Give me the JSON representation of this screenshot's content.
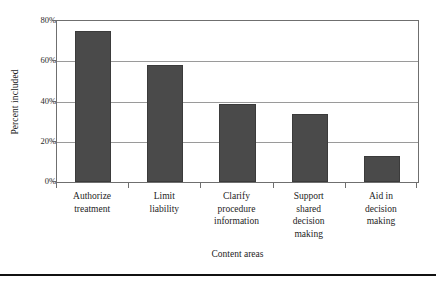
{
  "chart_data": {
    "type": "bar",
    "title": "",
    "xlabel": "Content areas",
    "ylabel": "Percent included",
    "categories": [
      "Authorize treatment",
      "Limit liability",
      "Clarify procedure information",
      "Support shared decision making",
      "Aid in decision making"
    ],
    "category_lines": [
      [
        "Authorize",
        "treatment"
      ],
      [
        "Limit",
        "liability"
      ],
      [
        "Clarify",
        "procedure",
        "information"
      ],
      [
        "Support",
        "shared",
        "decision",
        "making"
      ],
      [
        "Aid in",
        "decision",
        "making"
      ]
    ],
    "values": [
      75,
      58,
      39,
      34,
      13
    ],
    "ylim": [
      0,
      80
    ],
    "yticks": [
      0,
      20,
      40,
      60,
      80
    ],
    "ytick_labels": [
      "0%",
      "20%",
      "40%",
      "60%",
      "80%"
    ],
    "grid": true,
    "legend": "none",
    "bar_color": "#4a4a4a",
    "bar_edge_color": "#3b3b3b",
    "gridline_color": "#9a9a9a",
    "axis_color": "#6f6f6f",
    "background_color": "#ffffff"
  }
}
